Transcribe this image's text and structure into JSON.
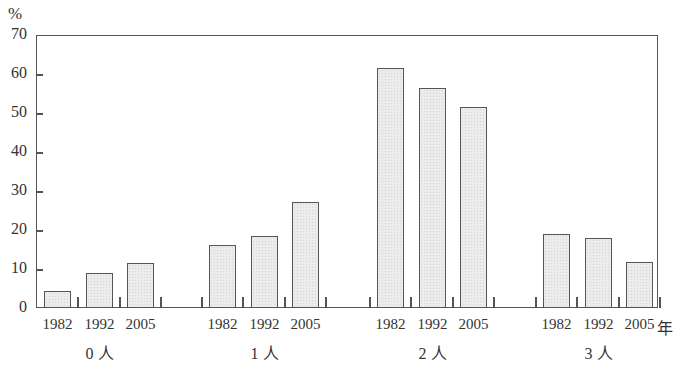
{
  "chart_data": {
    "type": "bar",
    "title": "",
    "ylabel": "%",
    "xlabel": "年",
    "ylim": [
      0,
      70
    ],
    "yticks": [
      0,
      10,
      20,
      30,
      40,
      50,
      60,
      70
    ],
    "groups": [
      "0 人",
      "1 人",
      "2 人",
      "3 人"
    ],
    "categories": [
      "1982",
      "1992",
      "2005"
    ],
    "series": [
      {
        "name": "0 人",
        "values": [
          4.4,
          8.9,
          11.5
        ]
      },
      {
        "name": "1 人",
        "values": [
          16.2,
          18.5,
          27.1
        ]
      },
      {
        "name": "2 人",
        "values": [
          61.5,
          56.3,
          51.6
        ]
      },
      {
        "name": "3 人",
        "values": [
          19.1,
          17.9,
          11.7
        ]
      }
    ],
    "grid": false,
    "legend": null
  },
  "labels": {
    "unit": "%",
    "year_suffix": "年",
    "yticks": [
      "70",
      "60",
      "50",
      "40",
      "30",
      "20",
      "10",
      "0"
    ],
    "years": [
      "1982",
      "1992",
      "2005"
    ],
    "groups": [
      "0 人",
      "1 人",
      "2 人",
      "3 人"
    ]
  }
}
